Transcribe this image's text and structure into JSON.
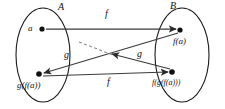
{
  "figure": {
    "kind": "function-composition-diagram",
    "background_color": "#ffffff",
    "ink_color": "#1a1a1a",
    "edge_color": "#3b3b3b",
    "dashed_color": "#8a8a8a"
  },
  "sets": [
    {
      "id": "A",
      "label": "A",
      "side": "left",
      "cx": 43,
      "cy": 55,
      "rx": 27,
      "ry": 47
    },
    {
      "id": "B",
      "label": "B",
      "side": "right",
      "cx": 182,
      "cy": 55,
      "rx": 27,
      "ry": 47
    }
  ],
  "set_labels": {
    "left": {
      "text": "A",
      "x": 58,
      "y": 7
    },
    "right": {
      "text": "B",
      "x": 170,
      "y": 6
    }
  },
  "nodes": [
    {
      "id": "a",
      "label": "a",
      "x": 42,
      "y": 29,
      "label_x": 29,
      "label_y": 23,
      "set": "A"
    },
    {
      "id": "fa",
      "label": "f(a)",
      "x": 180,
      "y": 30,
      "label_x": 176,
      "label_y": 37,
      "set": "B"
    },
    {
      "id": "gfa",
      "label": "g(f(a))",
      "x": 39,
      "y": 74,
      "label_x": 18,
      "label_y": 81,
      "set": "A"
    },
    {
      "id": "fgfa",
      "label": "f(g(f(a)))",
      "x": 172,
      "y": 72,
      "label_x": 155,
      "label_y": 79,
      "set": "B"
    }
  ],
  "edges": [
    {
      "id": "a-to-fa",
      "label": "f",
      "from": "a",
      "to": "fa",
      "style": "solid",
      "label_x": 107,
      "label_y": 12
    },
    {
      "id": "fa-to-gfa",
      "label": "g",
      "from": "fa",
      "to": "gfa",
      "style": "solid",
      "label_x": 137,
      "label_y": 52
    },
    {
      "id": "gfa-to-fgfa",
      "label": "f",
      "from": "gfa",
      "to": "fgfa",
      "style": "solid",
      "label_x": 108,
      "label_y": 78
    },
    {
      "id": "fgfa-to-gfgfa",
      "label": "g",
      "from": "fgfa",
      "to": "midpoint",
      "style": "solid",
      "label_x": 65,
      "label_y": 52
    },
    {
      "id": "continuation",
      "label": "",
      "from": "midpoint",
      "to": "open",
      "style": "dashed",
      "label_x": 0,
      "label_y": 0
    }
  ],
  "edge_labels": {
    "top_f": "f",
    "left_g": "g",
    "right_g": "g",
    "bottom_f": "f"
  }
}
